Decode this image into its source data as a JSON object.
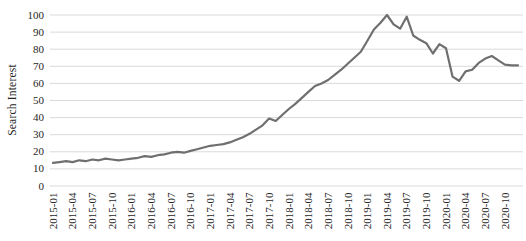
{
  "chart_data": {
    "type": "line",
    "title": "",
    "xlabel": "",
    "ylabel": "Search Interest",
    "ylim": [
      0,
      100
    ],
    "ytick_step": 10,
    "grid": true,
    "legend": "none",
    "x_tick_labels": [
      "2015-01",
      "2015-04",
      "2015-07",
      "2015-10",
      "2016-01",
      "2016-04",
      "2016-07",
      "2016-10",
      "2017-01",
      "2017-04",
      "2017-07",
      "2017-10",
      "2018-01",
      "2018-04",
      "2018-07",
      "2018-10",
      "2019-01",
      "2019-04",
      "2019-07",
      "2019-10",
      "2020-01",
      "2020-04",
      "2020-07",
      "2020-10"
    ],
    "x_tick_every_months": 3,
    "x": [
      "2015-01",
      "2015-02",
      "2015-03",
      "2015-04",
      "2015-05",
      "2015-06",
      "2015-07",
      "2015-08",
      "2015-09",
      "2015-10",
      "2015-11",
      "2015-12",
      "2016-01",
      "2016-02",
      "2016-03",
      "2016-04",
      "2016-05",
      "2016-06",
      "2016-07",
      "2016-08",
      "2016-09",
      "2016-10",
      "2016-11",
      "2016-12",
      "2017-01",
      "2017-02",
      "2017-03",
      "2017-04",
      "2017-05",
      "2017-06",
      "2017-07",
      "2017-08",
      "2017-09",
      "2017-10",
      "2017-11",
      "2017-12",
      "2018-01",
      "2018-02",
      "2018-03",
      "2018-04",
      "2018-05",
      "2018-06",
      "2018-07",
      "2018-08",
      "2018-09",
      "2018-10",
      "2018-11",
      "2018-12",
      "2019-01",
      "2019-02",
      "2019-03",
      "2019-04",
      "2019-05",
      "2019-06",
      "2019-07",
      "2019-08",
      "2019-09",
      "2019-10",
      "2019-11",
      "2019-12",
      "2020-01",
      "2020-02",
      "2020-03",
      "2020-04",
      "2020-05",
      "2020-06",
      "2020-07",
      "2020-08",
      "2020-09",
      "2020-10",
      "2020-11",
      "2020-12"
    ],
    "series": [
      {
        "name": "Search Interest",
        "values": [
          13.5,
          14,
          14.5,
          14,
          15,
          14.5,
          15.5,
          15,
          16,
          15.5,
          15,
          15.5,
          16,
          16.5,
          17.5,
          17,
          18,
          18.5,
          19.5,
          20,
          19.5,
          20.5,
          21.5,
          22.5,
          23.5,
          24,
          24.5,
          25.5,
          27,
          28.5,
          30.5,
          33,
          35.5,
          39.5,
          38,
          41.5,
          45,
          48,
          51.5,
          55,
          58.5,
          60,
          62,
          65,
          68,
          71.5,
          75,
          78.5,
          85,
          91.5,
          95.5,
          100,
          94.5,
          92,
          99,
          88,
          85.5,
          83.5,
          77.5,
          83,
          80.5,
          64,
          61.5,
          67,
          68,
          72,
          74.5,
          76,
          73.5,
          71,
          70.5,
          70.5
        ]
      }
    ],
    "colors": {
      "line": "#6f6f6f",
      "grid": "#d9d9d9",
      "text": "#262626",
      "background": "#ffffff"
    }
  }
}
